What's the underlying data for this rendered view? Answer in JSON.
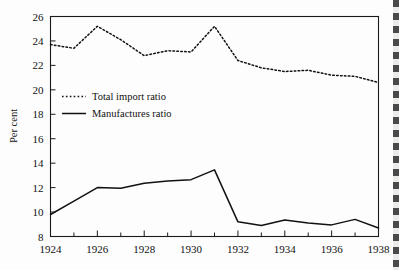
{
  "chart_data": {
    "type": "line",
    "title": "",
    "xlabel": "",
    "ylabel": "Per cent",
    "xlim": [
      1924,
      1938
    ],
    "ylim": [
      8,
      26
    ],
    "grid": false,
    "legend_position": "inside-upper-left",
    "x": [
      1924,
      1925,
      1926,
      1927,
      1928,
      1929,
      1930,
      1931,
      1932,
      1933,
      1934,
      1935,
      1936,
      1937,
      1938
    ],
    "xticks": [
      1924,
      1926,
      1928,
      1930,
      1932,
      1934,
      1936,
      1938
    ],
    "xtick_labels": [
      "1924",
      "1926",
      "1928",
      "1930",
      "1932",
      "1934",
      "1936",
      "1938"
    ],
    "xminor_ticks": [
      1925,
      1927,
      1929,
      1931,
      1933,
      1935,
      1937
    ],
    "yticks": [
      8,
      10,
      12,
      14,
      16,
      18,
      20,
      22,
      24,
      26
    ],
    "ytick_labels": [
      "8",
      "10",
      "12",
      "14",
      "16",
      "18",
      "20",
      "22",
      "24",
      "26"
    ],
    "series": [
      {
        "name": "Total import ratio",
        "style": "dashed",
        "color": "#111111",
        "values": [
          23.7,
          23.4,
          25.2,
          24.1,
          22.8,
          23.2,
          23.1,
          25.2,
          22.4,
          21.8,
          21.5,
          21.6,
          21.2,
          21.1,
          20.6
        ]
      },
      {
        "name": "Manufactures ratio",
        "style": "solid",
        "color": "#111111",
        "values": [
          9.8,
          10.9,
          12.0,
          11.95,
          12.35,
          12.55,
          12.65,
          13.45,
          9.2,
          8.9,
          9.35,
          9.1,
          8.95,
          9.4,
          8.7
        ]
      }
    ],
    "legend": [
      {
        "label": "Total import ratio",
        "style": "dashed"
      },
      {
        "label": "Manufactures ratio",
        "style": "solid"
      }
    ]
  }
}
